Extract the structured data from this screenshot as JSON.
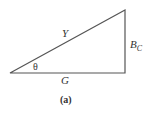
{
  "diagram": {
    "type": "right-triangle",
    "caption": "(a)",
    "labels": {
      "hypotenuse": "Y",
      "base": "G",
      "vertical_main": "B",
      "vertical_sub": "C",
      "angle": "θ"
    },
    "colors": {
      "line": "#555555",
      "text": "#333333"
    }
  }
}
